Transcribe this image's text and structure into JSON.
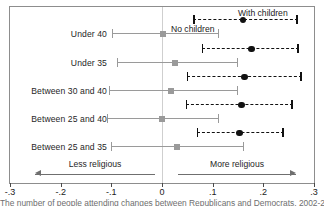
{
  "chart_data": {
    "type": "scatter",
    "title": "",
    "subtitle": "",
    "xlabel": "",
    "ylabel": "",
    "xlim": [
      -0.3,
      0.3
    ],
    "xticks": [
      -0.3,
      -0.2,
      -0.1,
      0,
      0.1,
      0.2,
      0.3
    ],
    "xticklabels": [
      "-.3",
      "-.2",
      "-.1",
      "0",
      ".1",
      ".2",
      ".3"
    ],
    "grid": false,
    "zero_reference_line": 0,
    "legend_position": "in-plot-annotations",
    "categories": [
      "Under 40",
      "Under 35",
      "Between 30 and 40",
      "Between 25 and 40",
      "Between 25 and 35"
    ],
    "series": [
      {
        "name": "With children",
        "marker": "filled-circle",
        "line_style": "dashed",
        "color": "#111111",
        "values": [
          0.16,
          0.177,
          0.163,
          0.157,
          0.153
        ],
        "ci_low": [
          0.062,
          0.079,
          0.049,
          0.047,
          0.069
        ],
        "ci_high": [
          0.268,
          0.27,
          0.276,
          0.258,
          0.24
        ]
      },
      {
        "name": "No children",
        "marker": "filled-square",
        "line_style": "solid",
        "color": "#9a9a9a",
        "values": [
          0.002,
          0.026,
          0.018,
          0.0,
          0.03
        ],
        "ci_low": [
          -0.098,
          -0.088,
          -0.104,
          -0.108,
          -0.1
        ],
        "ci_high": [
          0.112,
          0.151,
          0.151,
          0.112,
          0.161
        ]
      }
    ],
    "annotations": [
      {
        "text": "With children",
        "x": 0.23,
        "note": "label for dashed black series"
      },
      {
        "text": "No children",
        "x": 0.035,
        "note": "label for solid gray series"
      },
      {
        "text": "Less religious",
        "x": -0.18,
        "direction": "left"
      },
      {
        "text": "More religious",
        "x": 0.15,
        "direction": "right"
      }
    ]
  },
  "labels": {
    "rows": [
      "Under 40",
      "Under 35",
      "Between 30 and 40",
      "Between 25 and 40",
      "Between 25 and 35"
    ],
    "series_with_children": "With children",
    "series_no_children": "No children",
    "direction_less": "Less religious",
    "direction_more": "More religious",
    "ticks": [
      "-.3",
      "-.2",
      "-.1",
      "0",
      ".1",
      ".2",
      ".3"
    ],
    "caption": "The number of people attending changes between Republicans and Democrats, 2002-2004"
  },
  "colors": {
    "with_children": "#111111",
    "no_children": "#9a9a9a",
    "frame": "#8d8d8d",
    "zero_line": "#cfcfcf"
  }
}
